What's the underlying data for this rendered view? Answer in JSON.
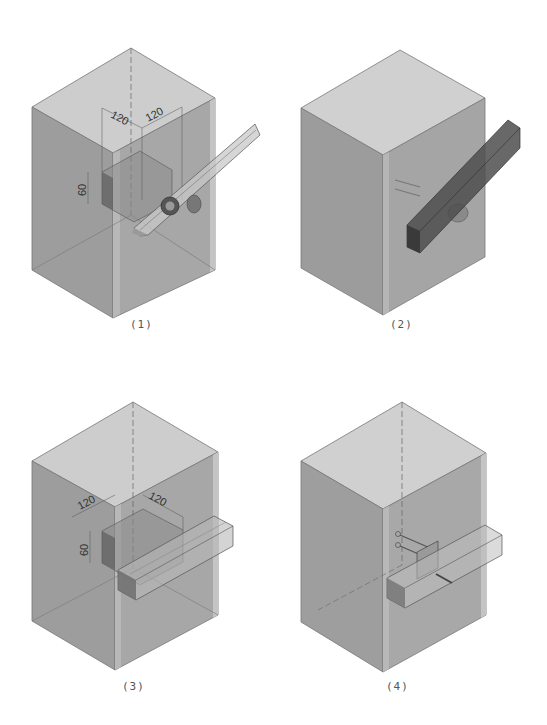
{
  "figures": [
    {
      "id": "1",
      "caption": "(1)",
      "description": "Transparent concrete block with dimensioned embedded pocket and inclined rectangular beam with round connector",
      "dimensions": {
        "top_left": "120",
        "top_right": "120",
        "height": "60"
      }
    },
    {
      "id": "2",
      "caption": "(2)",
      "description": "Opaque block with dark inclined beam attached via anchor bars and round connector"
    },
    {
      "id": "3",
      "caption": "(3)",
      "description": "Transparent block with dimensioned pocket and horizontal rectangular beam through pocket",
      "dimensions": {
        "top_left": "120",
        "top_right": "120",
        "height": "60"
      }
    },
    {
      "id": "4",
      "caption": "(4)",
      "description": "Transparent block with horizontal beam connected through steel plate and anchor bolts"
    }
  ],
  "colors": {
    "top_face": "#cfcfcf",
    "left_face": "#9e9e9e",
    "right_face": "#a8a8a8",
    "edge": "#6e6e6e",
    "beam_dark": "#4a4a4a",
    "beam_light": "#bdbdbd"
  }
}
